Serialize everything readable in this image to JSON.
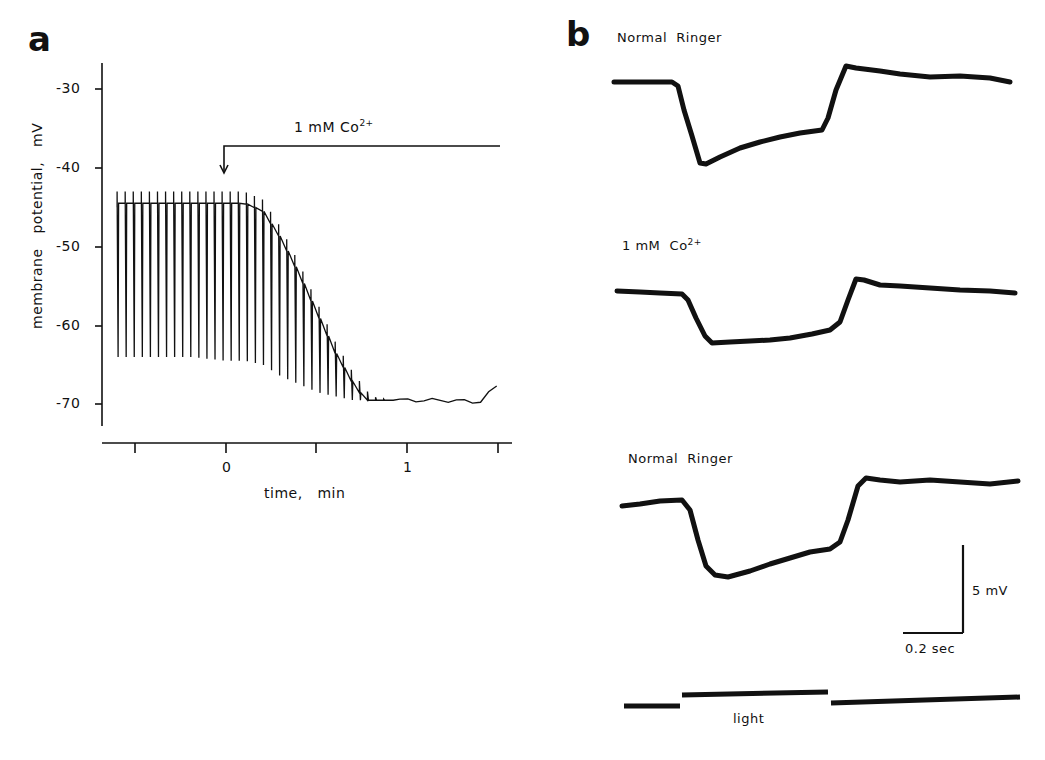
{
  "figure": {
    "panel_a": {
      "letter": "a",
      "annotation": "1 mM Co",
      "annotation_sup": "2+",
      "ylabel": "membrane   potential,   mV",
      "xlabel": "time,   min",
      "yticks": [
        "-30",
        "-40",
        "-50",
        "-60",
        "-70"
      ],
      "xticks": [
        "",
        "0",
        "",
        "1",
        ""
      ]
    },
    "panel_b": {
      "letter": "b",
      "trace_labels": [
        "Normal  Ringer",
        "1 mM  Co",
        "Normal  Ringer"
      ],
      "trace2_sup": "2+",
      "scale_v": "5 mV",
      "scale_t": "0.2 sec",
      "stimulus_label": "light"
    }
  },
  "chart_data": [
    {
      "type": "line",
      "title": "a",
      "xlabel": "time, min",
      "ylabel": "membrane potential, mV",
      "xlim": [
        -0.65,
        1.5
      ],
      "ylim": [
        -72,
        -27
      ],
      "xticks": [
        -0.5,
        0,
        0.5,
        1,
        1.5
      ],
      "yticks": [
        -30,
        -40,
        -50,
        -60,
        -70
      ],
      "annotation": {
        "text": "1 mM Co2+",
        "x": 0,
        "note": "arrow marks Co2+ application at t=0"
      },
      "series": [
        {
          "name": "spike peaks",
          "x": [
            -0.6,
            -0.4,
            -0.2,
            0,
            0.1,
            0.2,
            0.3,
            0.4,
            0.5,
            0.6,
            0.7,
            0.8,
            0.9,
            1.0,
            1.2,
            1.4,
            1.5
          ],
          "y": [
            -43,
            -43,
            -43,
            -43,
            -43,
            -44,
            -47.5,
            -52,
            -57,
            -62,
            -66,
            -69,
            -69.5,
            -69.5,
            -69.5,
            -69.5,
            -67.5
          ]
        },
        {
          "name": "baseline / troughs",
          "x": [
            -0.6,
            -0.4,
            -0.2,
            0,
            0.1,
            0.2,
            0.3,
            0.4,
            0.5,
            0.6,
            0.7,
            0.8,
            0.9,
            1.0,
            1.2,
            1.4,
            1.5
          ],
          "y": [
            -64,
            -64,
            -64,
            -64.5,
            -64.5,
            -65,
            -66.5,
            -67.5,
            -68.5,
            -69,
            -69.5,
            -69.5,
            -69.5,
            -69.5,
            -69.5,
            -69.7,
            -67.5
          ]
        }
      ]
    },
    {
      "type": "line",
      "title": "b",
      "xlabel": "time (scale bar 0.2 sec)",
      "ylabel": "voltage (scale bar 5 mV)",
      "series": [
        {
          "name": "Normal Ringer",
          "note": "hyperpolarizing light response ~5 mV peak, partial recovery, rebound overshoot at light off"
        },
        {
          "name": "1 mM Co2+",
          "note": "reduced response ~3.5 mV, flatter plateau"
        },
        {
          "name": "Normal Ringer (recovery)",
          "note": "response ~4.5 mV, partial recovery"
        }
      ],
      "stimulus": {
        "label": "light",
        "duration_sec": 0.5
      }
    }
  ]
}
